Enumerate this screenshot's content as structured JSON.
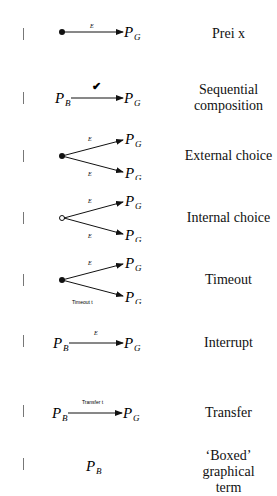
{
  "rows": [
    {
      "label": "Prei x",
      "arrow_label": "E",
      "target": "P",
      "target_sub": "G"
    },
    {
      "label": "Sequential composition",
      "arrow_label": "✔",
      "source": "P",
      "source_sub": "B",
      "target": "P",
      "target_sub": "G"
    },
    {
      "label": "External choice",
      "arrow_labels": [
        "E",
        "E"
      ],
      "target": "P",
      "target_sub": "G"
    },
    {
      "label": "Internal choice",
      "arrow_labels": [
        "E",
        "E"
      ],
      "target": "P",
      "target_sub": "G"
    },
    {
      "label": "Timeout",
      "arrow_labels": [
        "E",
        "Timeout t"
      ],
      "target": "P",
      "target_sub": "G"
    },
    {
      "label": "Interrupt",
      "arrow_label": "E",
      "source": "P",
      "source_sub": "B",
      "target": "P",
      "target_sub": "G"
    },
    {
      "label": "Transfer",
      "arrow_label": "Transfer t",
      "source": "P",
      "source_sub": "B",
      "target": "P",
      "target_sub": "G"
    },
    {
      "label": "'Boxed' graphical term",
      "source": "P",
      "source_sub": "B"
    }
  ],
  "labels": {
    "r0": "Prei x",
    "r1a": "Sequential",
    "r1b": "composition",
    "r2": "External choice",
    "r3": "Internal choice",
    "r4": "Timeout",
    "r5": "Interrupt",
    "r6": "Transfer",
    "r7a": "‘Boxed’ graphical",
    "r7b": "term"
  },
  "sym": {
    "P": "P",
    "B": "B",
    "G": "G",
    "E": "E",
    "tick": "✔",
    "timeout": "Timeout t",
    "transfer": "Transfer t"
  }
}
